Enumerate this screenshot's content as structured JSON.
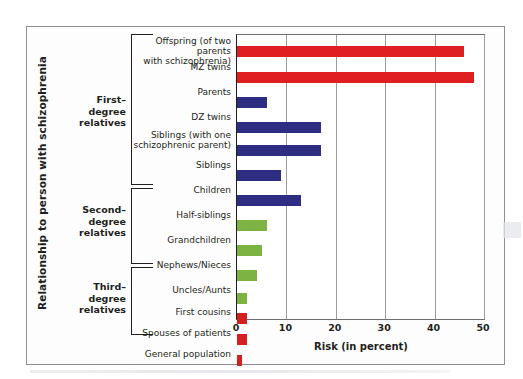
{
  "chart_data": {
    "type": "bar",
    "orientation": "horizontal",
    "title": "",
    "xlabel": "Risk (in percent)",
    "ylabel": "Relationship to person with schizophrenia",
    "xlim": [
      0,
      50
    ],
    "xticks": [
      0,
      10,
      20,
      30,
      40,
      50
    ],
    "grid": true,
    "legend": false,
    "categories": [
      "Offspring (of two parents with schizophrenia)",
      "MZ twins",
      "Parents",
      "DZ twins",
      "Siblings (with one schizophrenic parent)",
      "Siblings",
      "Children",
      "Half-siblings",
      "Grandchildren",
      "Nephews/Nieces",
      "Uncles/Aunts",
      "First cousins",
      "Spouses  of patients",
      "General population"
    ],
    "values": [
      46,
      48,
      6,
      17,
      17,
      9,
      13,
      6,
      5,
      4,
      2,
      2,
      2,
      1
    ],
    "bar_colors": [
      "#e02020",
      "#e02020",
      "#2d2d82",
      "#2d2d82",
      "#2d2d82",
      "#2d2d82",
      "#2d2d82",
      "#7cb342",
      "#7cb342",
      "#7cb342",
      "#7cb342",
      "#d32020",
      "#d32020",
      "#d32020"
    ],
    "groups": [
      {
        "label": "First–\ndegree\nrelatives",
        "label_lines": [
          "First–",
          "degree",
          "relatives"
        ],
        "categories": [
          0,
          1,
          2,
          3,
          4,
          5,
          6
        ]
      },
      {
        "label": "Second–\ndegree\nrelatives",
        "label_lines": [
          "Second–",
          "degree",
          "relatives"
        ],
        "categories": [
          7,
          8,
          9,
          10
        ]
      },
      {
        "label": "Third–\ndegree\nrelatives",
        "label_lines": [
          "Third–",
          "degree",
          "relatives"
        ],
        "categories": [
          11,
          12,
          13
        ]
      }
    ]
  },
  "axis": {
    "y_title": "Relationship to person with schizophrenia",
    "x_title": "Risk (in percent)",
    "x_tick_labels": [
      "0",
      "10",
      "20",
      "30",
      "40",
      "50"
    ]
  },
  "labels": {
    "cat_0_line_1": "Offspring (of two parents",
    "cat_0_line_2": "with schizophrenia)",
    "cat_1": "MZ twins",
    "cat_2": "Parents",
    "cat_3": "DZ twins",
    "cat_4_line_1": "Siblings (with one",
    "cat_4_line_2": "schizophrenic parent)",
    "cat_5": "Siblings",
    "cat_6": "Children",
    "cat_7": "Half-siblings",
    "cat_8": "Grandchildren",
    "cat_9": "Nephews/Nieces",
    "cat_10": "Uncles/Aunts",
    "cat_11": "First cousins",
    "cat_12": "Spouses  of patients",
    "cat_13": "General population"
  },
  "groups": {
    "first": {
      "line1": "First–",
      "line2": "degree",
      "line3": "relatives"
    },
    "second": {
      "line1": "Second–",
      "line2": "degree",
      "line3": "relatives"
    },
    "third": {
      "line1": "Third–",
      "line2": "degree",
      "line3": "relatives"
    }
  },
  "colors": {
    "red": "#e02020",
    "dark_red": "#d32020",
    "blue": "#2d2d82",
    "green": "#7cb342",
    "frame": "#8d8f94",
    "gridline": "#9a9c9f",
    "text": "#231f20"
  }
}
